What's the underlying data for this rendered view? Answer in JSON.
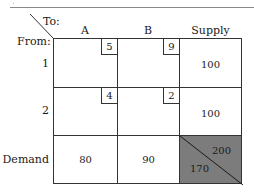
{
  "table": {
    "corner": {
      "to_label": "To:",
      "from_label": "From:"
    },
    "columns": [
      "A",
      "B",
      "Supply"
    ],
    "rows": [
      {
        "label": "1",
        "costs": [
          "5",
          "9"
        ],
        "supply": "100"
      },
      {
        "label": "2",
        "costs": [
          "4",
          "2"
        ],
        "supply": "100"
      }
    ],
    "demand_row": {
      "label": "Demand",
      "values": [
        "80",
        "90"
      ],
      "total_supply": "200",
      "total_demand": "170"
    }
  },
  "colors": {
    "grid_line": "#333333",
    "shaded_cell": "#7c7c7c",
    "background": "#ffffff"
  }
}
